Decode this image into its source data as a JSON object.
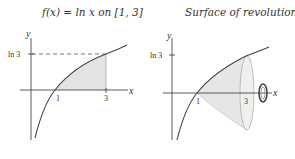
{
  "figures": [
    {
      "title": "f(x) = ln x on [1, 3]",
      "x_axis_label": "x",
      "y_axis_label": "y",
      "y_tick_label": "ln 3",
      "x_tick_labels": [
        "1",
        "3"
      ]
    },
    {
      "title": "Surface of revolution",
      "x_axis_label": "x",
      "y_axis_label": "y",
      "y_tick_label": "ln 3",
      "x_tick_labels": [
        "1",
        "3"
      ]
    }
  ],
  "colors": {
    "shade": "#e3e3e3",
    "curve": "#444444",
    "axis": "#333333"
  }
}
